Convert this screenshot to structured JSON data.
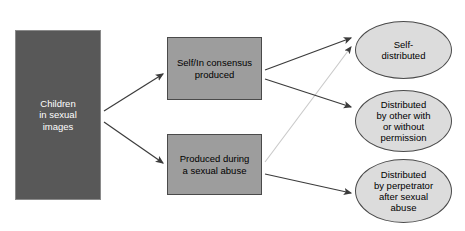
{
  "diagram": {
    "colors": {
      "source_fill": "#585858",
      "source_text": "#ffffff",
      "stage_fill": "#9d9d9d",
      "outcome_fill": "#dcdcdc",
      "node_stroke": "#4a4a4a",
      "edge_dark": "#3b3b3b",
      "edge_faded": "#c9c9c9",
      "background": "#ffffff"
    },
    "nodes": {
      "source": {
        "id": "children-in-sexual-images",
        "label": "Children\nin sexual\nimages",
        "shape": "rectangle",
        "x": 15,
        "y": 30,
        "width": 86,
        "height": 170
      },
      "stage_consensus": {
        "id": "self-in-consensus-produced",
        "label": "Self/In consensus\nproduced",
        "shape": "rectangle",
        "x": 167,
        "y": 37,
        "width": 95,
        "height": 63
      },
      "stage_abuse": {
        "id": "produced-during-a-sexual-abuse",
        "label": "Produced during\na sexual abuse",
        "shape": "rectangle",
        "x": 167,
        "y": 134,
        "width": 95,
        "height": 61
      },
      "outcome_self": {
        "id": "self-distributed",
        "label": "Self-\ndistributed",
        "shape": "ellipse",
        "x": 355,
        "y": 21,
        "width": 97,
        "height": 58
      },
      "outcome_other": {
        "id": "distributed-by-other",
        "label": "Distributed\nby other with\nor without\npermission",
        "shape": "ellipse",
        "x": 355,
        "y": 90,
        "width": 97,
        "height": 62
      },
      "outcome_perpetrator": {
        "id": "distributed-by-perpetrator",
        "label": "Distributed\nby perpetrator\nafter sexual\nabuse",
        "shape": "ellipse",
        "x": 355,
        "y": 159,
        "width": 97,
        "height": 64
      }
    },
    "edges": [
      {
        "id": "source-to-consensus",
        "from": "children-in-sexual-images",
        "to": "self-in-consensus-produced",
        "style": "solid-dark",
        "x1": 104,
        "y1": 111,
        "x2": 163,
        "y2": 74
      },
      {
        "id": "source-to-abuse",
        "from": "children-in-sexual-images",
        "to": "produced-during-a-sexual-abuse",
        "style": "solid-dark",
        "x1": 104,
        "y1": 122,
        "x2": 163,
        "y2": 163
      },
      {
        "id": "consensus-to-self-distributed",
        "from": "self-in-consensus-produced",
        "to": "self-distributed",
        "style": "solid-dark",
        "x1": 265,
        "y1": 70,
        "x2": 351,
        "y2": 38
      },
      {
        "id": "consensus-to-other",
        "from": "self-in-consensus-produced",
        "to": "distributed-by-other",
        "style": "solid-dark",
        "x1": 265,
        "y1": 79,
        "x2": 351,
        "y2": 107
      },
      {
        "id": "abuse-to-self-distributed",
        "from": "produced-during-a-sexual-abuse",
        "to": "self-distributed",
        "style": "solid-faded",
        "x1": 265,
        "y1": 162,
        "x2": 351,
        "y2": 47
      },
      {
        "id": "abuse-to-perpetrator",
        "from": "produced-during-a-sexual-abuse",
        "to": "distributed-by-perpetrator",
        "style": "solid-dark",
        "x1": 265,
        "y1": 174,
        "x2": 351,
        "y2": 193
      }
    ]
  }
}
